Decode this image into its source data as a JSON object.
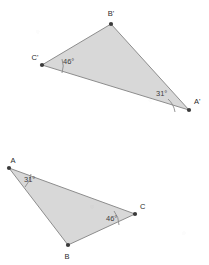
{
  "figure": {
    "type": "geometry-diagram",
    "background_color": "#ffffff",
    "fill_color": "#d6d6d6",
    "stroke_color": "#8d8d8d",
    "label_color": "#2a2a2a",
    "degree_symbol": "°"
  },
  "triangles": [
    {
      "id": "upper",
      "name": "triangle-a-prime-b-prime-c-prime",
      "vertices": [
        {
          "label": "B'",
          "x": 111,
          "y": 24,
          "label_x": 111,
          "label_y": 16
        },
        {
          "label": "A'",
          "x": 189,
          "y": 110,
          "label_x": 194,
          "label_y": 104
        },
        {
          "label": "C'",
          "x": 42,
          "y": 65,
          "label_x": 35,
          "label_y": 60
        }
      ],
      "angles": [
        {
          "at": "C'",
          "value": "46",
          "text": "46°",
          "text_x": 63,
          "text_y": 64
        },
        {
          "at": "A'",
          "value": "31",
          "text": "31°",
          "text_x": 156,
          "text_y": 96
        }
      ]
    },
    {
      "id": "lower",
      "name": "triangle-a-b-c",
      "vertices": [
        {
          "label": "A",
          "x": 9,
          "y": 168,
          "label_x": 13,
          "label_y": 163
        },
        {
          "label": "B",
          "x": 68,
          "y": 245,
          "label_x": 67,
          "label_y": 259
        },
        {
          "label": "C",
          "x": 135,
          "y": 214,
          "label_x": 140,
          "label_y": 209
        }
      ],
      "angles": [
        {
          "at": "A",
          "value": "31",
          "text": "31°",
          "text_x": 24,
          "text_y": 182
        },
        {
          "at": "C",
          "value": "46",
          "text": "46°",
          "text_x": 106,
          "text_y": 221
        }
      ]
    }
  ]
}
